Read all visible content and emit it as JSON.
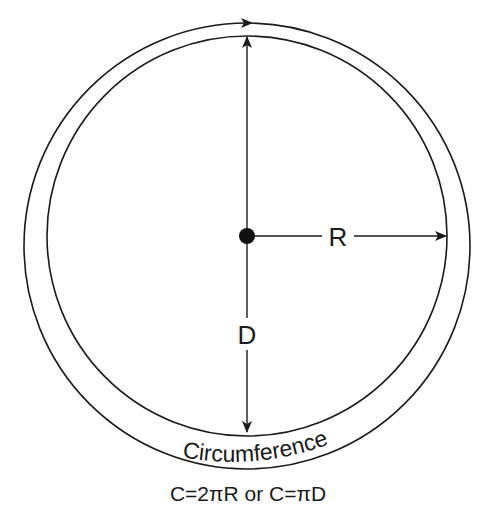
{
  "diagram": {
    "labels": {
      "radius": "R",
      "diameter": "D",
      "circumference": "Circumference",
      "formula": "C=2πR or C=πD"
    },
    "colors": {
      "stroke": "#1a1a1a",
      "background": "#ffffff"
    }
  }
}
